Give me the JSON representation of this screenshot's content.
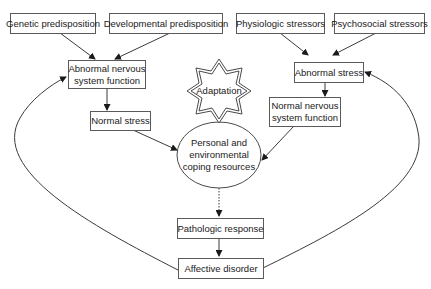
{
  "diagram": {
    "nodes": {
      "genetic": {
        "label": "Genetic predisposition",
        "shape": "rect"
      },
      "developmental": {
        "label": "Developmental predisposition",
        "shape": "rect"
      },
      "physiologic": {
        "label": "Physiologic stressors",
        "shape": "rect"
      },
      "psychosocial": {
        "label": "Psychosocial stressors",
        "shape": "rect"
      },
      "abnormal_nervous": {
        "line1": "Abnormal nervous",
        "line2": "system function",
        "shape": "rect"
      },
      "normal_stress": {
        "label": "Normal stress",
        "shape": "rect"
      },
      "abnormal_stress": {
        "label": "Abnormal stress",
        "shape": "rect"
      },
      "normal_nervous": {
        "line1": "Normal nervous",
        "line2": "system function",
        "shape": "rect"
      },
      "adaptation": {
        "label": "Adaptation",
        "shape": "eight-point-star-double-outline"
      },
      "coping": {
        "line1": "Personal and",
        "line2": "environmental",
        "line3": "coping resources",
        "shape": "ellipse"
      },
      "pathologic": {
        "label": "Pathologic response",
        "shape": "rect"
      },
      "affective": {
        "label": "Affective disorder",
        "shape": "rect"
      }
    },
    "edges": [
      {
        "from": "Genetic predisposition",
        "to": "Abnormal nervous system function",
        "style": "solid"
      },
      {
        "from": "Developmental predisposition",
        "to": "Abnormal nervous system function",
        "style": "solid"
      },
      {
        "from": "Physiologic stressors",
        "to": "Abnormal stress",
        "style": "solid"
      },
      {
        "from": "Psychosocial stressors",
        "to": "Abnormal stress",
        "style": "solid"
      },
      {
        "from": "Abnormal nervous system function",
        "to": "Normal stress",
        "style": "solid"
      },
      {
        "from": "Abnormal stress",
        "to": "Normal nervous system function",
        "style": "solid"
      },
      {
        "from": "Normal stress",
        "to": "Personal and environmental coping resources",
        "style": "solid"
      },
      {
        "from": "Normal nervous system function",
        "to": "Personal and environmental coping resources",
        "style": "solid"
      },
      {
        "from": "Personal and environmental coping resources",
        "to": "Adaptation",
        "style": "dotted"
      },
      {
        "from": "Personal and environmental coping resources",
        "to": "Pathologic response",
        "style": "dotted"
      },
      {
        "from": "Pathologic response",
        "to": "Affective disorder",
        "style": "solid"
      },
      {
        "from": "Affective disorder",
        "to": "Abnormal nervous system function",
        "style": "curved"
      },
      {
        "from": "Affective disorder",
        "to": "Abnormal stress",
        "style": "curved"
      }
    ],
    "colors": {
      "line": "#3a3a3a",
      "box_border": "#5a5a5a",
      "text": "#1a1a1a",
      "background": "#ffffff"
    }
  }
}
